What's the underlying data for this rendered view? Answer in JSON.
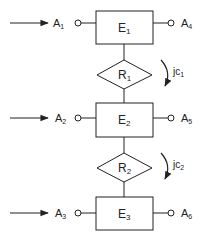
{
  "diagram": {
    "entities": [
      {
        "id": "E1",
        "label": "E",
        "sub": "1"
      },
      {
        "id": "E2",
        "label": "E",
        "sub": "2"
      },
      {
        "id": "E3",
        "label": "E",
        "sub": "3"
      }
    ],
    "relationships": [
      {
        "id": "R1",
        "label": "R",
        "sub": "1"
      },
      {
        "id": "R2",
        "label": "R",
        "sub": "2"
      }
    ],
    "inputs": [
      {
        "label": "A",
        "sub": "1"
      },
      {
        "label": "A",
        "sub": "2"
      },
      {
        "label": "A",
        "sub": "3"
      }
    ],
    "outputs": [
      {
        "label": "A",
        "sub": "4"
      },
      {
        "label": "A",
        "sub": "5"
      },
      {
        "label": "A",
        "sub": "6"
      }
    ],
    "constraints": [
      {
        "label": "jc",
        "sub": "1"
      },
      {
        "label": "jc",
        "sub": "2"
      }
    ]
  }
}
